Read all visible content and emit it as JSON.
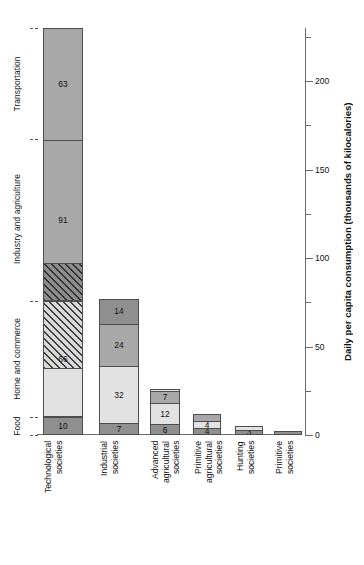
{
  "chart_data": {
    "type": "bar",
    "title": "",
    "subtitle": "",
    "xlabel": "",
    "ylabel": "Daily per capita consumption (thousands of kilocalories)",
    "ylim": [
      0,
      230
    ],
    "yticks_major": [
      0,
      50,
      100,
      150,
      200
    ],
    "yticks_minor": [
      25,
      75,
      125,
      175,
      225
    ],
    "ytick_labels": [
      "0",
      "50",
      "100",
      "150",
      "200"
    ],
    "grid": false,
    "legend_position": "left-axis",
    "stacked": true,
    "categories": [
      "Technological societies",
      "Industrial societies",
      "Advanced agricultural societies",
      "Primitive agricultural societies",
      "Hunting societies",
      "Primitive societies"
    ],
    "series": [
      {
        "name": "Food",
        "values": [
          10,
          7,
          6,
          4,
          3,
          2
        ]
      },
      {
        "name": "Home and commerce",
        "values": [
          66,
          32,
          12,
          4,
          2,
          0
        ]
      },
      {
        "name": "Industry and agriculture",
        "values": [
          91,
          24,
          7,
          4,
          0,
          0
        ]
      },
      {
        "name": "Transportation",
        "values": [
          63,
          14,
          1,
          0,
          0,
          0
        ]
      }
    ],
    "totals": [
      230,
      77,
      26,
      12,
      5,
      2
    ],
    "annotations": [
      "Top segment of 'Advanced agricultural societies' is labelled 1 above the bar"
    ]
  },
  "axis": {
    "title": "Daily per capita consumption (thousands of kilocalories)",
    "ticks": [
      {
        "value": 200,
        "label": "200"
      },
      {
        "value": 150,
        "label": "150"
      },
      {
        "value": 100,
        "label": "100"
      },
      {
        "value": 50,
        "label": "50"
      },
      {
        "value": 0,
        "label": "0"
      }
    ]
  },
  "category_axis": {
    "labels": [
      {
        "name": "Food",
        "text": "Food"
      },
      {
        "name": "Home and commerce",
        "text": "Home and commerce"
      },
      {
        "name": "Industry and agriculture",
        "text": "Industry and agriculture"
      },
      {
        "name": "Transportation",
        "text": "Transportation"
      }
    ]
  },
  "bars": [
    {
      "category": "Technological societies",
      "xlabel": "Technological\nsocieties",
      "segments": [
        {
          "series": "Food",
          "value": 10,
          "label": "10",
          "fill": "dark"
        },
        {
          "series": "Home and commerce",
          "value": 66,
          "label": "66",
          "fill": "light",
          "split": [
            28,
            38
          ],
          "hatched_part": "upper"
        },
        {
          "series": "Industry and agriculture",
          "value": 91,
          "label": "91",
          "fill": "mid",
          "split": [
            21,
            70
          ],
          "hatched_part": "lower"
        },
        {
          "series": "Transportation",
          "value": 63,
          "label": "63",
          "fill": "mid"
        }
      ]
    },
    {
      "category": "Industrial societies",
      "xlabel": "Industrial\nsocieties",
      "segments": [
        {
          "series": "Food",
          "value": 7,
          "label": "7",
          "fill": "dark"
        },
        {
          "series": "Home and commerce",
          "value": 32,
          "label": "32",
          "fill": "light"
        },
        {
          "series": "Industry and agriculture",
          "value": 24,
          "label": "24",
          "fill": "mid"
        },
        {
          "series": "Transportation",
          "value": 14,
          "label": "14",
          "fill": "dark"
        }
      ]
    },
    {
      "category": "Advanced agricultural societies",
      "xlabel": "Advanced\nagricultural\nsocieties",
      "segments": [
        {
          "series": "Food",
          "value": 6,
          "label": "6",
          "fill": "dark"
        },
        {
          "series": "Home and commerce",
          "value": 12,
          "label": "12",
          "fill": "light"
        },
        {
          "series": "Industry and agriculture",
          "value": 7,
          "label": "7",
          "fill": "mid"
        },
        {
          "series": "Transportation",
          "value": 1,
          "label": "1",
          "fill": "light",
          "label_above": true
        }
      ]
    },
    {
      "category": "Primitive agricultural societies",
      "xlabel": "Primitive\nagricultural\nsocieties",
      "segments": [
        {
          "series": "Food",
          "value": 4,
          "label": "4",
          "fill": "dark"
        },
        {
          "series": "Home and commerce",
          "value": 4,
          "label": "4",
          "fill": "light"
        },
        {
          "series": "Industry and agriculture",
          "value": 4,
          "label": "4",
          "fill": "mid",
          "label_above": true
        }
      ]
    },
    {
      "category": "Hunting societies",
      "xlabel": "Hunting\nsocieties",
      "segments": [
        {
          "series": "Food",
          "value": 3,
          "label": "3",
          "fill": "dark"
        },
        {
          "series": "Home and commerce",
          "value": 2,
          "label": "2",
          "fill": "light",
          "label_above": true
        }
      ]
    },
    {
      "category": "Primitive societies",
      "xlabel": "Primitive\nsocieties",
      "segments": [
        {
          "series": "Food",
          "value": 2,
          "label": "2",
          "fill": "dark",
          "label_above": true
        }
      ]
    }
  ],
  "colors": {
    "dark": "#8f8f8f",
    "mid": "#a8a8a8",
    "light": "#e2e2e2",
    "outline": "#4d4d4d",
    "axis": "#6b6b6b",
    "text": "#111111"
  }
}
